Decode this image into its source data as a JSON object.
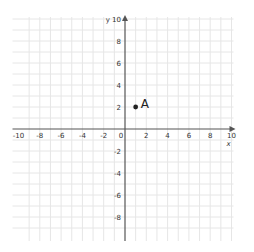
{
  "chart_data": {
    "type": "scatter",
    "title": "",
    "xlabel": "x",
    "ylabel": "y",
    "xlim": [
      -10,
      10
    ],
    "ylim": [
      -10,
      10
    ],
    "grid": true,
    "x_ticks": [
      -10,
      -8,
      -6,
      -4,
      -2,
      0,
      2,
      4,
      6,
      8,
      10
    ],
    "x_tick_labels": [
      "-10",
      "-8",
      "-6",
      "-4",
      "-2",
      "0",
      "2",
      "4",
      "6",
      "8",
      "10"
    ],
    "y_ticks": [
      10,
      8,
      6,
      4,
      2,
      -2,
      -4,
      -6,
      -8
    ],
    "y_tick_labels": [
      "10",
      "8",
      "6",
      "4",
      "2",
      "-2",
      "-4",
      "-6",
      "-8"
    ],
    "points": [
      {
        "label": "A",
        "x": 1,
        "y": 2
      }
    ]
  },
  "colors": {
    "grid": "#e6e6e6",
    "axis": "#555555",
    "point": "#222222"
  }
}
